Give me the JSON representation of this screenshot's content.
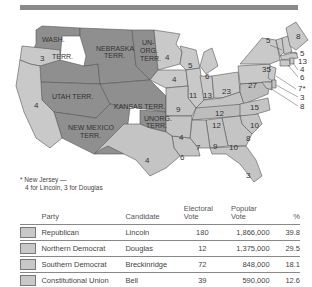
{
  "map": {
    "territories": [
      {
        "name": "WASH.",
        "line2": "TERR."
      },
      {
        "name": "NEBRASKA",
        "line2": "TERR."
      },
      {
        "name": "UN-",
        "line2": "ORG.",
        "line3": "TERR."
      },
      {
        "name": "UTAH TERR."
      },
      {
        "name": "KANSAS TERR."
      },
      {
        "name": "NEW MEXICO",
        "line2": "TERR."
      },
      {
        "name": "UNORG.",
        "line2": "TERR."
      }
    ],
    "states": {
      "oregon": "3",
      "california": "4",
      "minnesota": "4",
      "iowa": "4",
      "missouri": "9",
      "wisconsin": "5",
      "michigan": "6",
      "illinois": "11",
      "indiana": "13",
      "ohio": "23",
      "pennsylvania": "27",
      "new_york": "35",
      "kentucky": "12",
      "virginia": "15",
      "tennessee": "12",
      "north_carolina": "10",
      "south_carolina": "8",
      "georgia": "10",
      "alabama": "9",
      "mississippi": "7",
      "louisiana": "6",
      "arkansas": "4",
      "texas": "4",
      "florida": "3",
      "vermont": "5",
      "maine": "8",
      "new_hampshire": "5",
      "massachusetts": "13",
      "rhode_island": "4",
      "connecticut": "6",
      "new_jersey": "7*",
      "delaware": "3",
      "maryland": "8"
    },
    "footnote": {
      "line1": "* New Jersey —",
      "line2": "4 for Lincoln, 3 for Douglas"
    }
  },
  "table": {
    "headers": {
      "party": "Party",
      "candidate": "Candidate",
      "electoral_1": "Electoral",
      "electoral_2": "Vote",
      "popular_1": "Popular",
      "popular_2": "Vote",
      "percent": "%"
    },
    "rows": [
      {
        "party": "Republican",
        "candidate": "Lincoln",
        "electoral": "180",
        "popular": "1,866,000",
        "percent": "39.8"
      },
      {
        "party": "Northern Democrat",
        "candidate": "Douglas",
        "electoral": "12",
        "popular": "1,375,000",
        "percent": "29.5"
      },
      {
        "party": "Southern Democrat",
        "candidate": "Breckinridge",
        "electoral": "72",
        "popular": "848,000",
        "percent": "18.1"
      },
      {
        "party": "Constitutional Union",
        "candidate": "Bell",
        "electoral": "39",
        "popular": "590,000",
        "percent": "12.6"
      }
    ]
  }
}
